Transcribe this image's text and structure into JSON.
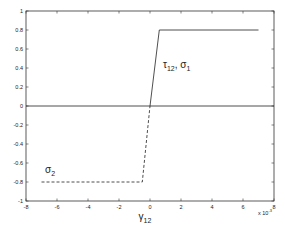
{
  "chart_data": {
    "type": "line",
    "title": "",
    "xlabel": "γ12",
    "ylabel": "",
    "x_multiplier": "x 10^-3",
    "xlim": [
      -0.008,
      0.008
    ],
    "ylim": [
      -1,
      1
    ],
    "xticks": [
      -8,
      -6,
      -4,
      -2,
      0,
      2,
      4,
      6,
      8
    ],
    "yticks": [
      -1,
      -0.8,
      -0.6,
      -0.4,
      -0.2,
      0,
      0.2,
      0.4,
      0.6,
      0.8,
      1
    ],
    "grid": false,
    "legend": null,
    "series": [
      {
        "name": "τ12, σ1",
        "style": "solid",
        "x": [
          0,
          0.0006,
          0.007
        ],
        "y": [
          0,
          0.8,
          0.8
        ]
      },
      {
        "name": "σ2",
        "style": "dashed",
        "x": [
          -0.007,
          -0.0005,
          0
        ],
        "y": [
          -0.8,
          -0.8,
          0
        ]
      },
      {
        "name": "zero line",
        "style": "solid",
        "x": [
          -0.008,
          0.008
        ],
        "y": [
          0,
          0
        ]
      }
    ],
    "annotations": [
      {
        "text": "τ12, σ1",
        "x": 0.0007,
        "y": 0.5
      },
      {
        "text": "σ2",
        "x": -0.0068,
        "y": -0.7
      }
    ]
  },
  "labels": {
    "xlabel_main": "γ",
    "xlabel_sub": "12",
    "multiplier_main": "x 10",
    "multiplier_exp": "-3",
    "annot1_tau": "τ",
    "annot1_tau_sub": "12",
    "annot1_sep": ", σ",
    "annot1_sigma_sub": "1",
    "annot2_sigma": "σ",
    "annot2_sigma_sub": "2"
  },
  "colors": {
    "line": "#222222",
    "axis": "#333333",
    "background": "#ffffff"
  }
}
